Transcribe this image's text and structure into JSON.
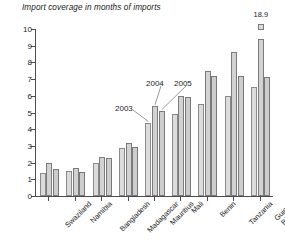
{
  "chart_data": {
    "type": "bar",
    "title": "Import coverage in months of imports",
    "xlabel": "",
    "ylabel": "",
    "ylim": [
      0,
      10
    ],
    "yticks": [
      0,
      1,
      2,
      3,
      4,
      5,
      6,
      7,
      8,
      9,
      10
    ],
    "grid": false,
    "legend_position": "none",
    "categories": [
      "Swaziland",
      "Namibia",
      "Bangladesh",
      "Madagascar",
      "Mauritius",
      "Mali",
      "Benin",
      "Tanzania",
      "Guinea\nBissau"
    ],
    "series": [
      {
        "name": "2003",
        "values": [
          1.35,
          1.5,
          1.95,
          2.9,
          4.4,
          4.9,
          5.5,
          6.0,
          6.5
        ]
      },
      {
        "name": "2004",
        "values": [
          2.0,
          1.7,
          2.35,
          3.15,
          5.4,
          6.0,
          7.5,
          8.6,
          18.9
        ]
      },
      {
        "name": "2005",
        "values": [
          1.6,
          1.45,
          2.3,
          2.95,
          5.1,
          5.9,
          7.2,
          7.2,
          7.1
        ]
      }
    ],
    "data_labels": [
      {
        "series": "2004",
        "category": "Guinea Bissau",
        "text": "18.9",
        "truncated": true
      }
    ],
    "annotations": [
      {
        "text": "2003",
        "points_to": "Mauritius 2003 bar"
      },
      {
        "text": "2004",
        "points_to": "Mauritius 2004 bar"
      },
      {
        "text": "2005",
        "points_to": "Mauritius 2005 bar"
      }
    ],
    "colors": {
      "bar_fill": "#d9d9d9",
      "bar_border": "#7a7a7a",
      "axis": "#4d4d4d",
      "text": "#1a1a1a",
      "background": "#ffffff"
    }
  }
}
